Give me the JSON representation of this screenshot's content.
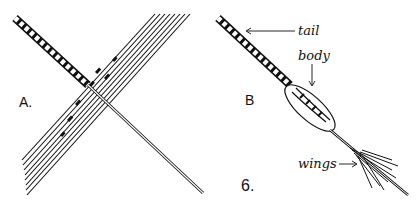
{
  "figure": {
    "number": "6.",
    "panels": [
      {
        "id": "A",
        "label": "A."
      },
      {
        "id": "B",
        "label": "B"
      }
    ],
    "annotations": {
      "tail": "tail",
      "body": "body",
      "wings": "wings"
    },
    "colors": {
      "ink": "#111111",
      "background": "#ffffff"
    }
  }
}
